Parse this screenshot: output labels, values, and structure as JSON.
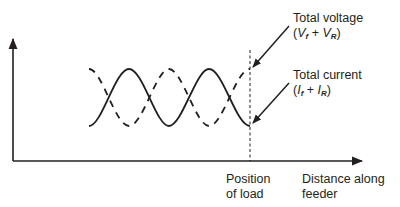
{
  "diagram": {
    "type": "standing-wave",
    "labels": {
      "voltage_title": "Total voltage",
      "voltage_formula": {
        "open": "(",
        "v1": "V",
        "v1_sub": "f",
        "plus": " + ",
        "v2": "V",
        "v2_sub": "R",
        "close": ")"
      },
      "current_title": "Total current",
      "current_formula": {
        "open": "(",
        "i1": "I",
        "i1_sub": "f",
        "plus": " + ",
        "i2": "I",
        "i2_sub": "R",
        "close": ")"
      },
      "load_line1": "Position",
      "load_line2": "of load",
      "xaxis_line1": "Distance along",
      "xaxis_line2": "feeder"
    },
    "series": [
      {
        "name": "Total voltage",
        "style": "dashed",
        "ends_at_load": "peak"
      },
      {
        "name": "Total current",
        "style": "solid",
        "ends_at_load": "trough"
      }
    ],
    "colors": {
      "ink": "#231f20",
      "background": "#ffffff"
    }
  }
}
